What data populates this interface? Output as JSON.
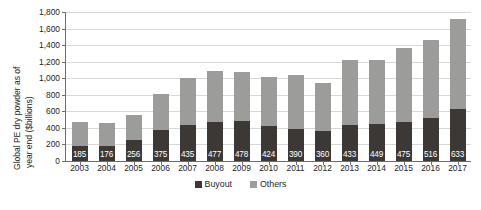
{
  "chart_data": {
    "type": "bar",
    "title": "",
    "xlabel": "",
    "ylabel": "Global PE dry powder as of year end ($billions)",
    "ylabel_line1": "Global PE dry powder as of",
    "ylabel_line2": "year end ($billions)",
    "ylim": [
      0,
      1800
    ],
    "ytick_step": 200,
    "grid": true,
    "stacked": true,
    "legend_position": "bottom-center",
    "categories": [
      "2003",
      "2004",
      "2005",
      "2006",
      "2007",
      "2008",
      "2009",
      "2010",
      "2011",
      "2012",
      "2013",
      "2014",
      "2015",
      "2016",
      "2017"
    ],
    "ytick_labels": [
      "1,800",
      "1,600",
      "1,400",
      "1,200",
      "1,000",
      "800",
      "600",
      "400",
      "200",
      "0"
    ],
    "ytick_values": [
      1800,
      1600,
      1400,
      1200,
      1000,
      800,
      600,
      400,
      200,
      0
    ],
    "series": [
      {
        "name": "Buyout",
        "color": "#3b3836",
        "labeled": true,
        "values": [
          185,
          176,
          256,
          375,
          435,
          477,
          478,
          424,
          390,
          360,
          433,
          449,
          475,
          516,
          633
        ],
        "value_labels": [
          "185",
          "176",
          "256",
          "375",
          "435",
          "477",
          "478",
          "424",
          "390",
          "360",
          "433",
          "449",
          "475",
          "516",
          "633"
        ]
      },
      {
        "name": "Others",
        "color": "#9c9c9a",
        "labeled": false,
        "values": [
          285,
          279,
          304,
          430,
          565,
          608,
          597,
          586,
          650,
          585,
          792,
          771,
          895,
          949,
          1087
        ]
      }
    ],
    "totals": [
      470,
      455,
      560,
      805,
      1000,
      1085,
      1075,
      1010,
      1040,
      945,
      1225,
      1220,
      1370,
      1465,
      1720
    ]
  },
  "legend": {
    "items": [
      {
        "label": "Buyout",
        "color": "#3b3836"
      },
      {
        "label": "Others",
        "color": "#9c9c9a"
      }
    ]
  },
  "caption": {
    "partial_text": ""
  },
  "colors": {
    "buyout": "#3b3836",
    "others": "#9c9c9a",
    "grid": "#d8d8d6",
    "axis": "#6d6d6d",
    "text": "#1d1d1d",
    "background": "#ffffff"
  }
}
